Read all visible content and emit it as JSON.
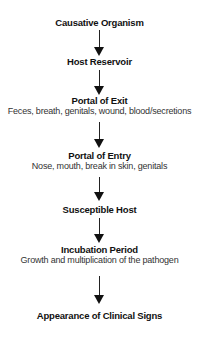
{
  "diagram": {
    "steps": [
      {
        "title": "Causative Organism",
        "subtitle": null
      },
      {
        "title": "Host Reservoir",
        "subtitle": null
      },
      {
        "title": "Portal of Exit",
        "subtitle": "Feces, breath, genitals, wound, blood/secretions"
      },
      {
        "title": "Portal of Entry",
        "subtitle": "Nose, mouth, break in skin, genitals"
      },
      {
        "title": "Susceptible Host",
        "subtitle": null
      },
      {
        "title": "Incubation Period",
        "subtitle": "Growth and multiplication of the pathogen"
      },
      {
        "title": "Appearance of Clinical Signs",
        "subtitle": null
      }
    ],
    "arrow_color": "#111111"
  }
}
